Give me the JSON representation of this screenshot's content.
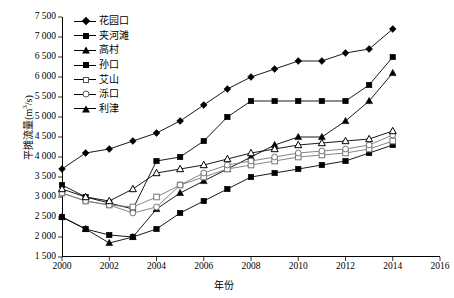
{
  "chart_data": {
    "type": "line",
    "title": "",
    "xlabel": "年份",
    "ylabel": "平摊流量(m3/s)",
    "ylabel_base": "平摊流量(m",
    "ylabel_sup": "3",
    "ylabel_tail": "/s)",
    "xlim": [
      2000,
      2016
    ],
    "ylim": [
      1500,
      7500
    ],
    "xticks": [
      2000,
      2002,
      2004,
      2006,
      2008,
      2010,
      2012,
      2014,
      2016
    ],
    "xtick_labels": [
      "2000",
      "2002",
      "2004",
      "2006",
      "2008",
      "2010",
      "2012",
      "2014",
      "2016"
    ],
    "yticks": [
      1500,
      2000,
      2500,
      3000,
      3500,
      4000,
      4500,
      5000,
      5500,
      6000,
      6500,
      7000,
      7500
    ],
    "ytick_labels": [
      "1 500",
      "2 000",
      "2 500",
      "3 000",
      "3 500",
      "4 000",
      "4 500",
      "5 000",
      "5 500",
      "6 000",
      "6 500",
      "7 000",
      "7 500"
    ],
    "grid": false,
    "legend_position": "upper-left-inside",
    "x": [
      2000,
      2001,
      2002,
      2003,
      2004,
      2005,
      2006,
      2007,
      2008,
      2009,
      2010,
      2011,
      2012,
      2013,
      2014
    ],
    "series": [
      {
        "name": "花园口",
        "marker": "filled-diamond",
        "color": "#000000",
        "values": [
          3700,
          4100,
          4200,
          4400,
          4600,
          4900,
          5300,
          5700,
          6000,
          6200,
          6400,
          6400,
          6600,
          6700,
          7200
        ]
      },
      {
        "name": "夹河滩",
        "marker": "filled-square",
        "color": "#000000",
        "values": [
          3300,
          3000,
          2850,
          2700,
          3900,
          4000,
          4400,
          5000,
          5400,
          5400,
          5400,
          5400,
          5400,
          5800,
          6500
        ]
      },
      {
        "name": "高村",
        "marker": "filled-triangle",
        "color": "#000000",
        "values": [
          2500,
          2200,
          1850,
          2000,
          2700,
          3100,
          3400,
          3700,
          4000,
          4300,
          4500,
          4500,
          4900,
          5400,
          6100
        ]
      },
      {
        "name": "孙口",
        "marker": "filled-square",
        "color": "#000000",
        "values": [
          2500,
          2200,
          2050,
          2000,
          2200,
          2600,
          2900,
          3200,
          3500,
          3600,
          3700,
          3800,
          3900,
          4100,
          4300
        ]
      },
      {
        "name": "艾山",
        "marker": "open-square",
        "color": "#777777",
        "values": [
          3100,
          2900,
          2800,
          2750,
          3000,
          3300,
          3500,
          3700,
          3800,
          3900,
          4000,
          4050,
          4100,
          4200,
          4400
        ]
      },
      {
        "name": "泺口",
        "marker": "open-circle",
        "color": "#777777",
        "values": [
          3100,
          2900,
          2800,
          2600,
          2750,
          3300,
          3600,
          3800,
          3900,
          4000,
          4100,
          4150,
          4200,
          4300,
          4550
        ]
      },
      {
        "name": "利津",
        "marker": "open-triangle",
        "color": "#000000",
        "values": [
          3200,
          3000,
          2900,
          3200,
          3600,
          3700,
          3800,
          3950,
          4100,
          4200,
          4300,
          4350,
          4400,
          4450,
          4650
        ]
      }
    ]
  },
  "legend": {
    "items": [
      {
        "label": "花园口",
        "marker": "filled-diamond"
      },
      {
        "label": "夹河滩",
        "marker": "filled-square"
      },
      {
        "label": "高村",
        "marker": "filled-triangle"
      },
      {
        "label": "孙口",
        "marker": "filled-square"
      },
      {
        "label": "艾山",
        "marker": "open-square"
      },
      {
        "label": "泺口",
        "marker": "open-circle"
      },
      {
        "label": "利津",
        "marker": "open-triangle"
      }
    ]
  }
}
